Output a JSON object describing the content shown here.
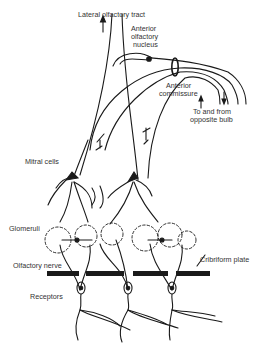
{
  "diagram": {
    "labels": {
      "lateral_tract": "Lateral olfactory tract",
      "anterior_nucleus_1": "Anterior",
      "anterior_nucleus_2": "olfactory",
      "anterior_nucleus_3": "nucleus",
      "anterior_commissure_1": "Anterior",
      "anterior_commissure_2": "commissure",
      "opposite_bulb_1": "To and from",
      "opposite_bulb_2": "opposite bulb",
      "mitral_cells": "Mitral cells",
      "glomeruli": "Glomeruli",
      "olfactory_nerve": "Olfactory nerve",
      "cribriform_plate": "Cribriform plate",
      "receptors": "Receptors"
    },
    "synapse_marks": {
      "plus": "+",
      "minus": "−",
      "granule": "g",
      "periglomerular": "p"
    },
    "colors": {
      "line": "#1a1a1a",
      "text": "#333333",
      "background": "#ffffff"
    }
  }
}
